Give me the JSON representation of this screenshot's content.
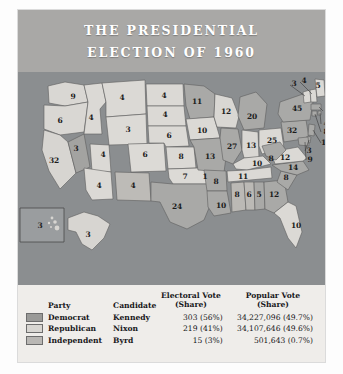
{
  "figure": {
    "title_line1": "THE PRESIDENTIAL",
    "title_line2": "ELECTION OF 1960"
  },
  "colors": {
    "header_band": "#a9a8a6",
    "ocean": "#8b8e90",
    "table_bg": "#efedea",
    "democrat_swatch": "#9a9a98",
    "republican_swatch": "#d8d6d2",
    "independent_swatch": "#b9b7b4",
    "title_text": "#ffffff",
    "label_text": "#1c1c1c"
  },
  "table": {
    "headers": {
      "party": "Party",
      "candidate": "Candidate",
      "electoral_l1": "Electoral Vote",
      "electoral_l2": "(Share)",
      "popular_l1": "Popular Vote",
      "popular_l2": "(Share)"
    },
    "rows": [
      {
        "swatch": "democrat-swatch",
        "party": "Democrat",
        "candidate": "Kennedy",
        "electoral": "303 (56%)",
        "popular": "34,227,096 (49.7%)"
      },
      {
        "swatch": "republican-swatch",
        "party": "Republican",
        "candidate": "Nixon",
        "electoral": "219 (41%)",
        "popular": "34,107,646 (49.6%)"
      },
      {
        "swatch": "independent-swatch",
        "party": "Independent",
        "candidate": "Byrd",
        "electoral": "15 (3%)",
        "popular": "501,643 (0.7%)"
      }
    ]
  },
  "chart_data": {
    "type": "map",
    "title": "THE PRESIDENTIAL ELECTION OF 1960",
    "legend_position": "bottom",
    "value_label": "Electoral votes",
    "series": [
      {
        "name": "Democrat",
        "candidate": "Kennedy",
        "electoral_votes": 303,
        "electoral_share": "56%",
        "popular_votes": 34227096,
        "popular_share": "49.7%"
      },
      {
        "name": "Republican",
        "candidate": "Nixon",
        "electoral_votes": 219,
        "electoral_share": "41%",
        "popular_votes": 34107646,
        "popular_share": "49.6%"
      },
      {
        "name": "Independent",
        "candidate": "Byrd",
        "electoral_votes": 15,
        "electoral_share": "3%",
        "popular_votes": 501643,
        "popular_share": "0.7%"
      }
    ],
    "states": [
      {
        "code": "WA",
        "votes": 9,
        "party": "Republican"
      },
      {
        "code": "OR",
        "votes": 6,
        "party": "Republican"
      },
      {
        "code": "CA",
        "votes": 32,
        "party": "Republican"
      },
      {
        "code": "NV",
        "votes": 3,
        "party": "Democrat"
      },
      {
        "code": "ID",
        "votes": 4,
        "party": "Republican"
      },
      {
        "code": "MT",
        "votes": 4,
        "party": "Republican"
      },
      {
        "code": "WY",
        "votes": 3,
        "party": "Republican"
      },
      {
        "code": "UT",
        "votes": 4,
        "party": "Republican"
      },
      {
        "code": "AZ",
        "votes": 4,
        "party": "Republican"
      },
      {
        "code": "NM",
        "votes": 4,
        "party": "Democrat"
      },
      {
        "code": "CO",
        "votes": 6,
        "party": "Republican"
      },
      {
        "code": "ND",
        "votes": 4,
        "party": "Republican"
      },
      {
        "code": "SD",
        "votes": 4,
        "party": "Republican"
      },
      {
        "code": "NE",
        "votes": 6,
        "party": "Republican"
      },
      {
        "code": "KS",
        "votes": 8,
        "party": "Republican"
      },
      {
        "code": "OK",
        "votes": 7,
        "party": "Republican"
      },
      {
        "code": "OK-unpledged",
        "votes": 1,
        "party": "Independent"
      },
      {
        "code": "TX",
        "votes": 24,
        "party": "Democrat"
      },
      {
        "code": "MN",
        "votes": 11,
        "party": "Democrat"
      },
      {
        "code": "IA",
        "votes": 10,
        "party": "Republican"
      },
      {
        "code": "MO",
        "votes": 13,
        "party": "Democrat"
      },
      {
        "code": "AR",
        "votes": 8,
        "party": "Democrat"
      },
      {
        "code": "LA",
        "votes": 10,
        "party": "Democrat"
      },
      {
        "code": "WI",
        "votes": 12,
        "party": "Republican"
      },
      {
        "code": "MI",
        "votes": 20,
        "party": "Democrat"
      },
      {
        "code": "IL",
        "votes": 27,
        "party": "Democrat"
      },
      {
        "code": "IN",
        "votes": 13,
        "party": "Republican"
      },
      {
        "code": "OH",
        "votes": 25,
        "party": "Republican"
      },
      {
        "code": "KY",
        "votes": 10,
        "party": "Republican"
      },
      {
        "code": "TN",
        "votes": 11,
        "party": "Republican"
      },
      {
        "code": "MS",
        "votes": 8,
        "party": "Independent"
      },
      {
        "code": "AL",
        "votes": 6,
        "party": "Independent"
      },
      {
        "code": "AL-dem",
        "votes": 5,
        "party": "Democrat"
      },
      {
        "code": "GA",
        "votes": 12,
        "party": "Democrat"
      },
      {
        "code": "FL",
        "votes": 10,
        "party": "Republican"
      },
      {
        "code": "SC",
        "votes": 8,
        "party": "Democrat"
      },
      {
        "code": "NC",
        "votes": 14,
        "party": "Democrat"
      },
      {
        "code": "VA",
        "votes": 12,
        "party": "Republican"
      },
      {
        "code": "WV",
        "votes": 8,
        "party": "Democrat"
      },
      {
        "code": "PA",
        "votes": 32,
        "party": "Democrat"
      },
      {
        "code": "NY",
        "votes": 45,
        "party": "Democrat"
      },
      {
        "code": "VT",
        "votes": 3,
        "party": "Republican"
      },
      {
        "code": "NH",
        "votes": 4,
        "party": "Republican"
      },
      {
        "code": "ME",
        "votes": 5,
        "party": "Republican"
      },
      {
        "code": "MA",
        "votes": 16,
        "party": "Democrat"
      },
      {
        "code": "RI",
        "votes": 4,
        "party": "Democrat"
      },
      {
        "code": "CT",
        "votes": 8,
        "party": "Democrat"
      },
      {
        "code": "NJ",
        "votes": 16,
        "party": "Democrat"
      },
      {
        "code": "DE",
        "votes": 3,
        "party": "Democrat"
      },
      {
        "code": "MD",
        "votes": 9,
        "party": "Democrat"
      },
      {
        "code": "AK",
        "votes": 3,
        "party": "Republican"
      },
      {
        "code": "HI",
        "votes": 3,
        "party": "Democrat"
      }
    ]
  },
  "map_labels": [
    {
      "name": "wa",
      "text": "9",
      "x": 55,
      "y": 24
    },
    {
      "name": "or",
      "text": "6",
      "x": 42,
      "y": 48
    },
    {
      "name": "ca",
      "text": "32",
      "x": 36,
      "y": 88
    },
    {
      "name": "nv",
      "text": "3",
      "x": 58,
      "y": 76
    },
    {
      "name": "id",
      "text": "4",
      "x": 73,
      "y": 45
    },
    {
      "name": "mt",
      "text": "4",
      "x": 104,
      "y": 25
    },
    {
      "name": "wy",
      "text": "3",
      "x": 110,
      "y": 57
    },
    {
      "name": "ut",
      "text": "4",
      "x": 85,
      "y": 82
    },
    {
      "name": "az",
      "text": "4",
      "x": 81,
      "y": 113
    },
    {
      "name": "nm",
      "text": "4",
      "x": 115,
      "y": 113
    },
    {
      "name": "co",
      "text": "6",
      "x": 127,
      "y": 82
    },
    {
      "name": "nd",
      "text": "4",
      "x": 146,
      "y": 23
    },
    {
      "name": "sd",
      "text": "4",
      "x": 147,
      "y": 42
    },
    {
      "name": "ne",
      "text": "6",
      "x": 151,
      "y": 63
    },
    {
      "name": "ks",
      "text": "8",
      "x": 163,
      "y": 84
    },
    {
      "name": "ok",
      "text": "7",
      "x": 167,
      "y": 104
    },
    {
      "name": "ok-unpledged",
      "text": "1",
      "x": 187,
      "y": 104
    },
    {
      "name": "tx",
      "text": "24",
      "x": 159,
      "y": 134
    },
    {
      "name": "mn",
      "text": "11",
      "x": 179,
      "y": 29
    },
    {
      "name": "ia",
      "text": "10",
      "x": 184,
      "y": 58
    },
    {
      "name": "mo",
      "text": "13",
      "x": 192,
      "y": 84
    },
    {
      "name": "ar",
      "text": "8",
      "x": 198,
      "y": 109
    },
    {
      "name": "la",
      "text": "10",
      "x": 203,
      "y": 133
    },
    {
      "name": "wi",
      "text": "12",
      "x": 208,
      "y": 39
    },
    {
      "name": "mi",
      "text": "20",
      "x": 234,
      "y": 44
    },
    {
      "name": "il",
      "text": "27",
      "x": 214,
      "y": 74
    },
    {
      "name": "in",
      "text": "13",
      "x": 233,
      "y": 73
    },
    {
      "name": "oh",
      "text": "25",
      "x": 254,
      "y": 68
    },
    {
      "name": "ky",
      "text": "10",
      "x": 239,
      "y": 91
    },
    {
      "name": "tn",
      "text": "11",
      "x": 225,
      "y": 104
    },
    {
      "name": "ms",
      "text": "8",
      "x": 219,
      "y": 122
    },
    {
      "name": "al",
      "text": "6",
      "x": 231,
      "y": 122
    },
    {
      "name": "al-dem",
      "text": "5",
      "x": 241,
      "y": 122
    },
    {
      "name": "ga",
      "text": "12",
      "x": 256,
      "y": 122
    },
    {
      "name": "fl",
      "text": "10",
      "x": 278,
      "y": 153
    },
    {
      "name": "sc",
      "text": "8",
      "x": 268,
      "y": 105
    },
    {
      "name": "nc",
      "text": "14",
      "x": 275,
      "y": 95
    },
    {
      "name": "va",
      "text": "12",
      "x": 267,
      "y": 85
    },
    {
      "name": "wv",
      "text": "8",
      "x": 253,
      "y": 86
    },
    {
      "name": "pa",
      "text": "32",
      "x": 274,
      "y": 58
    },
    {
      "name": "ny",
      "text": "45",
      "x": 279,
      "y": 36
    },
    {
      "name": "vt",
      "text": "3",
      "x": 276,
      "y": 11
    },
    {
      "name": "nh",
      "text": "4",
      "x": 286,
      "y": 8
    },
    {
      "name": "me",
      "text": "5",
      "x": 300,
      "y": 13
    },
    {
      "name": "ma",
      "text": "16",
      "x": 312,
      "y": 38
    },
    {
      "name": "ri",
      "text": "4",
      "x": 308,
      "y": 51
    },
    {
      "name": "ct",
      "text": "8",
      "x": 308,
      "y": 59
    },
    {
      "name": "nj",
      "text": "16",
      "x": 308,
      "y": 70
    },
    {
      "name": "de",
      "text": "3",
      "x": 291,
      "y": 78
    },
    {
      "name": "md",
      "text": "9",
      "x": 292,
      "y": 87
    },
    {
      "name": "ak",
      "text": "3",
      "x": 70,
      "y": 162
    },
    {
      "name": "hi",
      "text": "3",
      "x": 22,
      "y": 153
    }
  ]
}
